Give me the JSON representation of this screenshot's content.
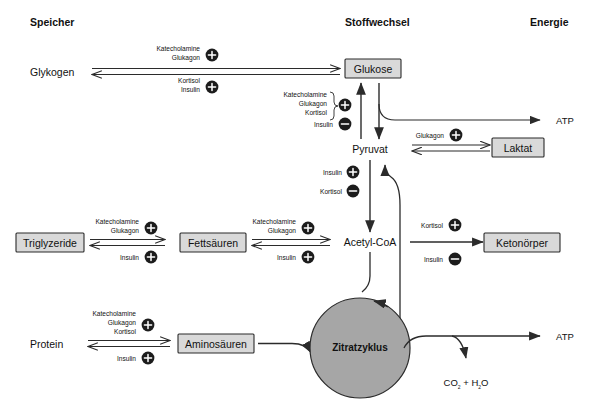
{
  "figure": {
    "columns": [
      {
        "id": "speicher",
        "label": "Speicher",
        "x": 30
      },
      {
        "id": "stoffwechsel",
        "label": "Stoffwechsel",
        "x": 345
      },
      {
        "id": "energie",
        "label": "Energie",
        "x": 530
      }
    ]
  },
  "colors": {
    "box_fill": "#d9d9d9",
    "box_stroke": "#2b2b2b",
    "cycle_fill": "#a6a6a6",
    "line": "#2b2b2b",
    "sign_fill": "#1c1c1c",
    "sign_glyph": "#ffffff",
    "background": "#ffffff"
  },
  "nodes": {
    "glykogen": {
      "label": "Glykogen",
      "boxed": false
    },
    "glukose": {
      "label": "Glukose",
      "boxed": true
    },
    "pyruvat": {
      "label": "Pyruvat",
      "boxed": false
    },
    "laktat": {
      "label": "Laktat",
      "boxed": true
    },
    "triglyzeride": {
      "label": "Triglyzeride",
      "boxed": true
    },
    "fettsaeuren": {
      "label": "Fettsäuren",
      "boxed": true
    },
    "acetyl_coa": {
      "label": "Acetyl-CoA",
      "boxed": false
    },
    "ketonkoerper": {
      "label": "Ketonörper",
      "boxed": true
    },
    "protein": {
      "label": "Protein",
      "boxed": false
    },
    "aminosaeuren": {
      "label": "Aminosäuren",
      "boxed": true
    },
    "zitratzyklus": {
      "label": "Zitratzyklus",
      "boxed": false
    },
    "atp_top": {
      "label": "ATP",
      "boxed": false
    },
    "atp_bottom": {
      "label": "ATP",
      "boxed": false
    },
    "co2_h2o": {
      "label": "CO",
      "sub1": "2",
      "plus": " + H",
      "sub2": "2",
      "tail": "O"
    }
  },
  "regulators": {
    "glykogen_to_glukose": {
      "above": {
        "lines": [
          "Katecholamine",
          "Glukagon"
        ],
        "sign": "plus"
      },
      "below": {
        "lines": [
          "Kortisol",
          "Insulin"
        ],
        "sign": "plus"
      }
    },
    "pyruvat_to_glukose": {
      "stimulating": {
        "lines": [
          "Katecholamine",
          "Glukagon",
          "Kortisol"
        ],
        "sign": "plus"
      },
      "inhibiting": {
        "lines": [
          "Insulin"
        ],
        "sign": "minus"
      }
    },
    "pyruvat_to_acetyl": {
      "stimulating": {
        "lines": [
          "Insulin"
        ],
        "sign": "plus"
      },
      "inhibiting": {
        "lines": [
          "Kortisol"
        ],
        "sign": "minus"
      }
    },
    "pyruvat_to_laktat": {
      "above": {
        "lines": [
          "Glukagon"
        ],
        "sign": "plus"
      }
    },
    "triglyzeride_to_fettsaeuren": {
      "above": {
        "lines": [
          "Katecholamine",
          "Glukagon"
        ],
        "sign": "plus"
      },
      "below": {
        "lines": [
          "Insulin"
        ],
        "sign": "plus"
      }
    },
    "fettsaeuren_to_acetyl": {
      "above": {
        "lines": [
          "Katecholamine",
          "Glukagon"
        ],
        "sign": "plus"
      },
      "below": {
        "lines": [
          "Insulin"
        ],
        "sign": "plus"
      }
    },
    "acetyl_to_ketone": {
      "above": {
        "lines": [
          "Kortisol"
        ],
        "sign": "plus"
      },
      "below": {
        "lines": [
          "Insulin"
        ],
        "sign": "minus"
      }
    },
    "protein_to_aminosaeuren": {
      "above": {
        "lines": [
          "Katecholamine",
          "Glukagon",
          "Kortisol"
        ],
        "sign": "plus"
      },
      "below": {
        "lines": [
          "Insulin"
        ],
        "sign": "plus"
      }
    }
  },
  "signs": {
    "plus": "+",
    "minus": "−"
  }
}
